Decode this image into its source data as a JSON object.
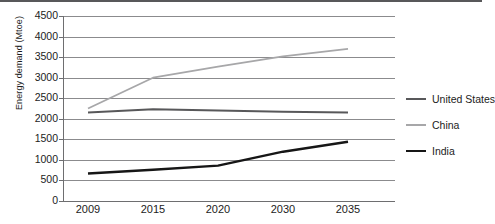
{
  "chart_data": {
    "type": "line",
    "title": "",
    "xlabel": "",
    "ylabel": "Energy demand (Mtoe)",
    "categories": [
      "2009",
      "2015",
      "2020",
      "2030",
      "2035"
    ],
    "ylim": [
      0,
      4500
    ],
    "yticks": [
      0,
      500,
      1000,
      1500,
      2000,
      2500,
      3000,
      3500,
      4000,
      4500
    ],
    "ytick_labels": [
      "0",
      "500",
      "1000",
      "1500",
      "2000",
      "2500",
      "3000",
      "3500",
      "4000",
      "4500"
    ],
    "grid": true,
    "legend_position": "right",
    "series": [
      {
        "name": "United States",
        "color": "#58585a",
        "width": 2.0,
        "values": [
          2150,
          2230,
          2200,
          2170,
          2150
        ]
      },
      {
        "name": "China",
        "color": "#a7a7a9",
        "width": 1.8,
        "values": [
          2250,
          3000,
          3270,
          3520,
          3700
        ]
      },
      {
        "name": "India",
        "color": "#161616",
        "width": 2.4,
        "values": [
          670,
          760,
          860,
          1200,
          1440
        ]
      }
    ]
  },
  "legend": {
    "items": [
      {
        "label": "United States",
        "color": "#58585a",
        "thickness": "2px"
      },
      {
        "label": "China",
        "color": "#a7a7a9",
        "thickness": "1.6px"
      },
      {
        "label": "India",
        "color": "#161616",
        "thickness": "2.6px"
      }
    ]
  },
  "axes": {
    "y_title": "Energy demand (Mtoe)"
  }
}
